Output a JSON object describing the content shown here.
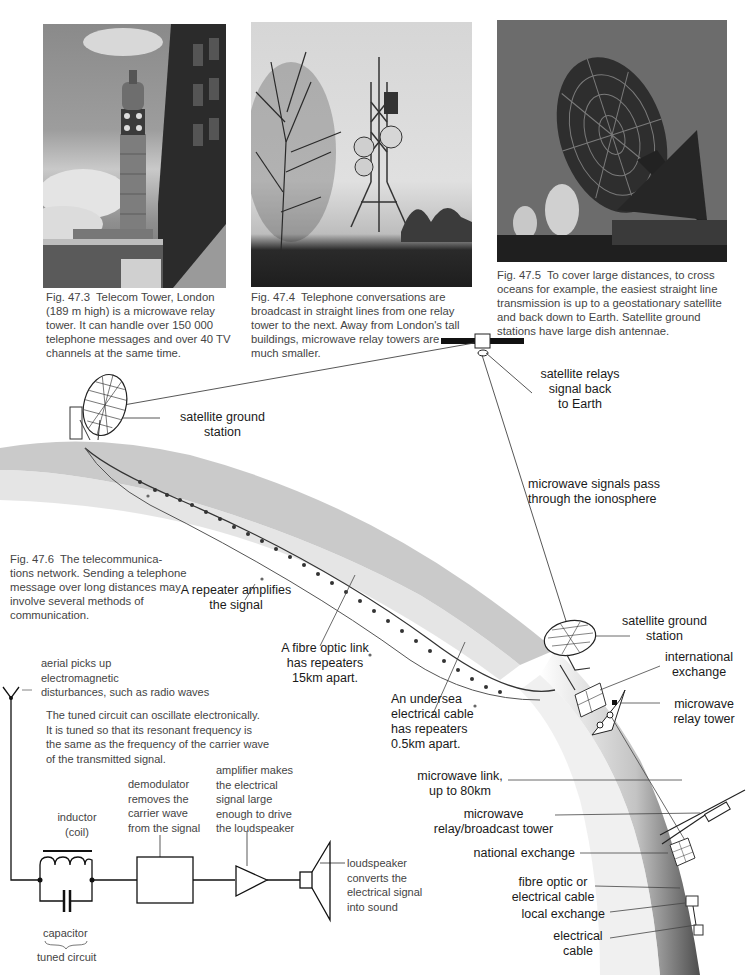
{
  "photos": [
    {
      "id": "fig-47-3",
      "subject": "Telecom Tower, London",
      "caption_fig": "Fig. 47.3",
      "caption_lines": [
        "Telecom Tower, London",
        "(189 m high) is a microwave relay",
        "tower. It can handle over 150 000",
        "telephone messages and over 40 TV",
        "channels at the same time."
      ]
    },
    {
      "id": "fig-47-4",
      "subject": "microwave relay tower",
      "caption_fig": "Fig. 47.4",
      "caption_lines": [
        "Telephone conversations are",
        "broadcast in straight lines from one relay",
        "tower to the next. Away from London's tall",
        "buildings, microwave relay towers are",
        "much smaller."
      ]
    },
    {
      "id": "fig-47-5",
      "subject": "satellite ground station dish antennae",
      "caption_fig": "Fig. 47.5",
      "caption_lines": [
        "To cover large distances, to cross",
        "oceans for example, the easiest straight line",
        "transmission is up to a geostationary satellite",
        "and back down to Earth. Satellite ground",
        "stations have large dish antennae."
      ]
    }
  ],
  "network_diagram": {
    "caption_fig": "Fig. 47.6",
    "caption_lines": [
      "The telecommunica-",
      "tions network. Sending a telephone",
      "message over long distances may",
      "involve several methods of",
      "communication."
    ],
    "labels": {
      "satellite_relays": [
        "satellite relays",
        "signal back",
        "to Earth"
      ],
      "ground_station_left": [
        "satellite ground",
        "station"
      ],
      "ionosphere": [
        "microwave signals pass",
        "through the ionosphere"
      ],
      "repeater": [
        "A repeater amplifies",
        "the signal"
      ],
      "fibre_optic_link": [
        "A fibre optic link",
        "has repeaters",
        "15km apart."
      ],
      "undersea_cable": [
        "An undersea",
        "electrical cable",
        "has repeaters",
        "0.5km apart."
      ],
      "ground_station_right": [
        "satellite ground",
        "station"
      ],
      "international_exchange": [
        "international",
        "exchange"
      ],
      "microwave_relay_tower": [
        "microwave",
        "relay tower"
      ],
      "microwave_link": [
        "microwave link,",
        "up to 80km"
      ],
      "broadcast_tower": [
        "microwave",
        "relay/broadcast tower"
      ],
      "national_exchange": [
        "national exchange"
      ],
      "fibre_or_electrical": [
        "fibre optic or",
        "electrical cable"
      ],
      "local_exchange": [
        "local exchange"
      ],
      "electrical_cable": [
        "electrical",
        "cable"
      ]
    }
  },
  "radio_circuit": {
    "aerial": [
      "aerial picks up",
      "electromagnetic",
      "disturbances, such as radio waves"
    ],
    "tuned_note": [
      "The tuned circuit can oscillate electronically.",
      "It is tuned so that its resonant frequency is",
      "the same as the frequency of the carrier wave",
      "of the transmitted signal."
    ],
    "inductor": [
      "inductor",
      "(coil)"
    ],
    "capacitor": "capacitor",
    "tuned_circuit": "tuned circuit",
    "demodulator": [
      "demodulator",
      "removes the",
      "carrier wave",
      "from the signal"
    ],
    "amplifier": [
      "amplifier makes",
      "the electrical",
      "signal large",
      "enough to drive",
      "the loudspeaker"
    ],
    "loudspeaker": [
      "loudspeaker",
      "converts the",
      "electrical signal",
      "into sound"
    ]
  }
}
